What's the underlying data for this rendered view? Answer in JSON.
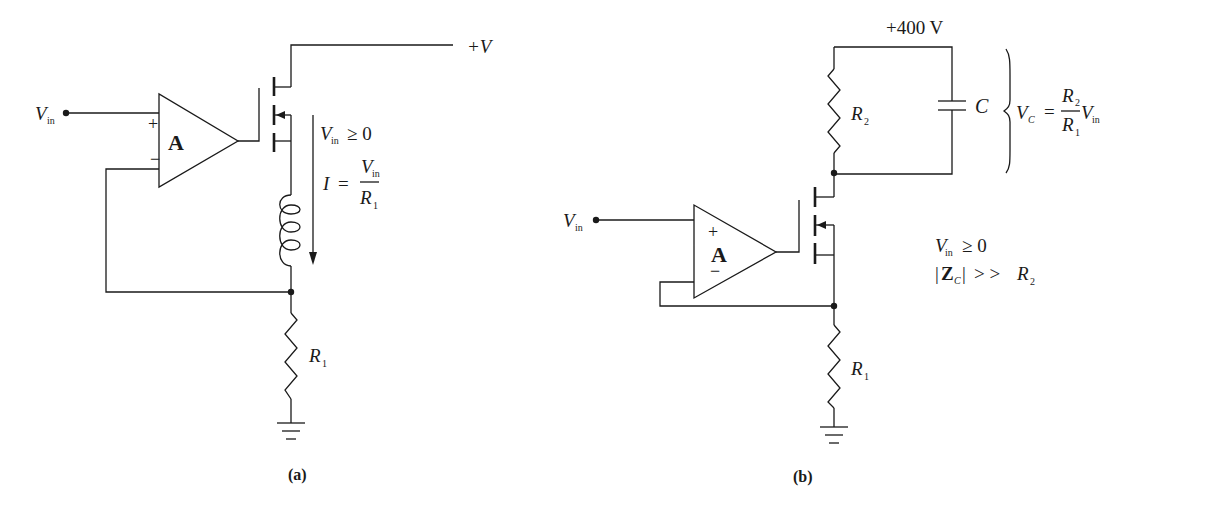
{
  "figure": {
    "panels": [
      {
        "id": "a",
        "caption": "(a)",
        "labels": {
          "vin_main": "V",
          "vin_sub": "in",
          "opamp": "A",
          "plus": "+",
          "minus": "−",
          "supply": "+V",
          "cond_v": "V",
          "cond_sub": "in",
          "cond_rest": "≥ 0",
          "eq_lhs": "I",
          "eq_eq": "=",
          "eq_num": "V",
          "eq_num_sub": "in",
          "eq_den": "R",
          "eq_den_sub": "1",
          "r1_main": "R",
          "r1_sub": "1"
        }
      },
      {
        "id": "b",
        "caption": "(b)",
        "labels": {
          "vin_main": "V",
          "vin_sub": "in",
          "opamp": "A",
          "plus": "+",
          "minus": "−",
          "supply": "+400 V",
          "r2_main": "R",
          "r2_sub": "2",
          "cap": "C",
          "vc_main": "V",
          "vc_sub": "C",
          "vc_eq": "=",
          "vc_num": "R",
          "vc_num_sub": "2",
          "vc_den": "R",
          "vc_den_sub": "1",
          "vc_vin": "V",
          "vc_vin_sub": "in",
          "cond1_v": "V",
          "cond1_sub": "in",
          "cond1_rest": "≥ 0",
          "cond2_open": "|",
          "cond2_z": "Z",
          "cond2_zsub": "C",
          "cond2_close": "|",
          "cond2_rest": "> >",
          "cond2_r": "R",
          "cond2_rsub": "2",
          "r1_main": "R",
          "r1_sub": "1"
        }
      }
    ]
  }
}
